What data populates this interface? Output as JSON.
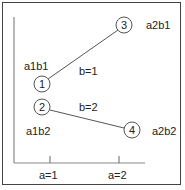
{
  "diagram": {
    "nodes": [
      {
        "id": "1",
        "label": "1",
        "cell": "a1b1",
        "cx": 42,
        "cy": 84
      },
      {
        "id": "2",
        "label": "2",
        "cell": "a1b2",
        "cx": 42,
        "cy": 107
      },
      {
        "id": "3",
        "label": "3",
        "cell": "a2b1",
        "cx": 124,
        "cy": 25
      },
      {
        "id": "4",
        "label": "4",
        "cell": "a2b2",
        "cx": 132,
        "cy": 130
      }
    ],
    "lines": [
      {
        "from": "1",
        "to": "3",
        "label": "b=1"
      },
      {
        "from": "2",
        "to": "4",
        "label": "b=2"
      }
    ],
    "cell_labels": {
      "a1b1": "a1b1",
      "a2b1": "a2b1",
      "a1b2": "a1b2",
      "a2b2": "a2b2"
    },
    "line_labels": {
      "b1": "b=1",
      "b2": "b=2"
    },
    "x_axis": {
      "ticks": [
        {
          "label": "a=1",
          "x": 50
        },
        {
          "label": "a=2",
          "x": 119
        }
      ]
    },
    "colors": {
      "line": "#555555",
      "axis": "#888888",
      "border": "#444444",
      "text": "#222222"
    }
  }
}
